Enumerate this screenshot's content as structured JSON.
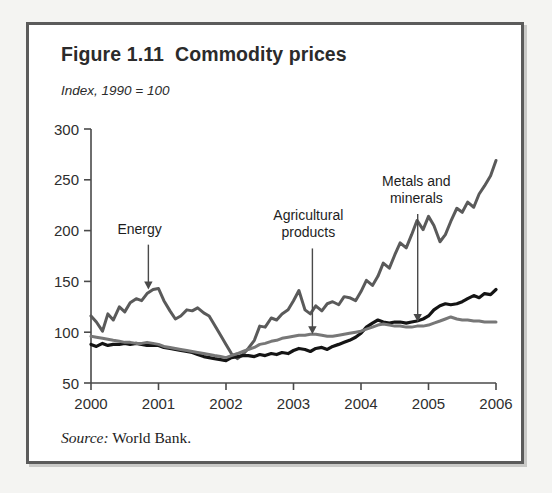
{
  "figure": {
    "title": "Figure 1.11  Commodity prices",
    "subtitle": "Index, 1990 = 100",
    "source_lead": "Source:",
    "source_text": " World Bank."
  },
  "chart_data": {
    "type": "line",
    "title": "Figure 1.11  Commodity prices",
    "subtitle": "Index, 1990 = 100",
    "xlabel": "",
    "ylabel": "Index, 1990 = 100",
    "xlim": [
      2000,
      2006
    ],
    "ylim": [
      50,
      300
    ],
    "xticks": [
      2000,
      2001,
      2002,
      2003,
      2004,
      2005,
      2006
    ],
    "xtick_labels": [
      "2000",
      "2001",
      "2002",
      "2003",
      "2004",
      "2005",
      "2006"
    ],
    "yticks": [
      50,
      100,
      150,
      200,
      250,
      300
    ],
    "ytick_labels": [
      "50",
      "100",
      "150",
      "200",
      "250",
      "300"
    ],
    "grid": false,
    "legend": "none",
    "annotations": [
      {
        "text": "Energy",
        "lines": [
          "Energy"
        ],
        "label_x": 2000.72,
        "label_y": 197,
        "arrow_x": 2000.85,
        "arrow_to_y": 142
      },
      {
        "text": "Agricultural products",
        "lines": [
          "Agricultural",
          "products"
        ],
        "label_x": 2003.22,
        "label_y": 210,
        "arrow_x": 2003.28,
        "arrow_to_y": 98
      },
      {
        "text": "Metals and minerals",
        "lines": [
          "Metals and",
          "minerals"
        ],
        "label_x": 2004.82,
        "label_y": 244,
        "arrow_x": 2004.84,
        "arrow_to_y": 110
      }
    ],
    "series": [
      {
        "name": "Energy",
        "color": "#5a5a5a",
        "width": 3.0,
        "x": [
          2000.0,
          2000.08,
          2000.17,
          2000.25,
          2000.33,
          2000.42,
          2000.5,
          2000.58,
          2000.67,
          2000.75,
          2000.83,
          2000.92,
          2001.0,
          2001.08,
          2001.17,
          2001.25,
          2001.33,
          2001.42,
          2001.5,
          2001.58,
          2001.67,
          2001.75,
          2001.83,
          2001.92,
          2002.0,
          2002.08,
          2002.17,
          2002.25,
          2002.33,
          2002.42,
          2002.5,
          2002.58,
          2002.67,
          2002.75,
          2002.83,
          2002.92,
          2003.0,
          2003.08,
          2003.17,
          2003.25,
          2003.33,
          2003.42,
          2003.5,
          2003.58,
          2003.67,
          2003.75,
          2003.83,
          2003.92,
          2004.0,
          2004.08,
          2004.17,
          2004.25,
          2004.33,
          2004.42,
          2004.5,
          2004.58,
          2004.67,
          2004.75,
          2004.83,
          2004.92,
          2005.0,
          2005.08,
          2005.17,
          2005.25,
          2005.33,
          2005.42,
          2005.5,
          2005.58,
          2005.67,
          2005.75,
          2005.83,
          2005.92,
          2006.0
        ],
        "y": [
          116,
          110,
          101,
          118,
          112,
          125,
          120,
          129,
          133,
          131,
          138,
          142,
          143,
          131,
          121,
          113,
          116,
          122,
          121,
          124,
          119,
          116,
          107,
          97,
          88,
          79,
          74,
          78,
          84,
          92,
          106,
          105,
          114,
          112,
          118,
          122,
          131,
          141,
          122,
          118,
          126,
          121,
          128,
          130,
          127,
          135,
          134,
          131,
          140,
          151,
          146,
          155,
          168,
          163,
          176,
          188,
          183,
          196,
          210,
          201,
          214,
          205,
          189,
          196,
          209,
          222,
          218,
          228,
          223,
          236,
          244,
          254,
          269
        ]
      },
      {
        "name": "Metals and minerals",
        "color": "#141414",
        "width": 3.2,
        "x": [
          2000.0,
          2000.08,
          2000.17,
          2000.25,
          2000.33,
          2000.42,
          2000.5,
          2000.58,
          2000.67,
          2000.75,
          2000.83,
          2000.92,
          2001.0,
          2001.08,
          2001.17,
          2001.25,
          2001.33,
          2001.42,
          2001.5,
          2001.58,
          2001.67,
          2001.75,
          2001.83,
          2001.92,
          2002.0,
          2002.08,
          2002.17,
          2002.25,
          2002.33,
          2002.42,
          2002.5,
          2002.58,
          2002.67,
          2002.75,
          2002.83,
          2002.92,
          2003.0,
          2003.08,
          2003.17,
          2003.25,
          2003.33,
          2003.42,
          2003.5,
          2003.58,
          2003.67,
          2003.75,
          2003.83,
          2003.92,
          2004.0,
          2004.08,
          2004.17,
          2004.25,
          2004.33,
          2004.42,
          2004.5,
          2004.58,
          2004.67,
          2004.75,
          2004.83,
          2004.92,
          2005.0,
          2005.08,
          2005.17,
          2005.25,
          2005.33,
          2005.42,
          2005.5,
          2005.58,
          2005.67,
          2005.75,
          2005.83,
          2005.92,
          2006.0
        ],
        "y": [
          88,
          86,
          89,
          87,
          88,
          88,
          89,
          88,
          89,
          88,
          87,
          87,
          87,
          85,
          84,
          83,
          82,
          81,
          80,
          78,
          76,
          75,
          74,
          73,
          72,
          75,
          76,
          77,
          77,
          76,
          78,
          77,
          79,
          78,
          80,
          79,
          82,
          84,
          83,
          81,
          84,
          85,
          83,
          86,
          88,
          90,
          92,
          95,
          99,
          105,
          109,
          112,
          110,
          109,
          110,
          110,
          109,
          110,
          111,
          113,
          116,
          122,
          126,
          128,
          127,
          128,
          130,
          133,
          136,
          134,
          138,
          137,
          142
        ]
      },
      {
        "name": "Agricultural products",
        "color": "#777777",
        "width": 3.0,
        "x": [
          2000.0,
          2000.08,
          2000.17,
          2000.25,
          2000.33,
          2000.42,
          2000.5,
          2000.58,
          2000.67,
          2000.75,
          2000.83,
          2000.92,
          2001.0,
          2001.08,
          2001.17,
          2001.25,
          2001.33,
          2001.42,
          2001.5,
          2001.58,
          2001.67,
          2001.75,
          2001.83,
          2001.92,
          2002.0,
          2002.08,
          2002.17,
          2002.25,
          2002.33,
          2002.42,
          2002.5,
          2002.58,
          2002.67,
          2002.75,
          2002.83,
          2002.92,
          2003.0,
          2003.08,
          2003.17,
          2003.25,
          2003.33,
          2003.42,
          2003.5,
          2003.58,
          2003.67,
          2003.75,
          2003.83,
          2003.92,
          2004.0,
          2004.08,
          2004.17,
          2004.25,
          2004.33,
          2004.42,
          2004.5,
          2004.58,
          2004.67,
          2004.75,
          2004.83,
          2004.92,
          2005.0,
          2005.08,
          2005.17,
          2005.25,
          2005.33,
          2005.42,
          2005.5,
          2005.58,
          2005.67,
          2005.75,
          2005.83,
          2005.92,
          2006.0
        ],
        "y": [
          96,
          95,
          94,
          93,
          92,
          91,
          90,
          90,
          89,
          89,
          90,
          89,
          88,
          86,
          85,
          84,
          83,
          82,
          81,
          80,
          79,
          78,
          77,
          76,
          75,
          77,
          79,
          81,
          83,
          85,
          88,
          89,
          91,
          92,
          94,
          95,
          96,
          97,
          97,
          98,
          98,
          97,
          96,
          96,
          97,
          98,
          99,
          100,
          101,
          103,
          105,
          107,
          108,
          107,
          106,
          106,
          105,
          105,
          106,
          106,
          107,
          109,
          111,
          113,
          115,
          113,
          112,
          112,
          111,
          111,
          110,
          110,
          110
        ]
      }
    ]
  }
}
